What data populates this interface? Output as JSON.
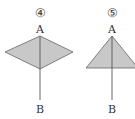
{
  "figures": [
    {
      "number": "④",
      "shape": "rhombus",
      "top_label": "A",
      "bottom_label": "B"
    },
    {
      "number": "⑤",
      "shape": "triangle",
      "top_label": "A",
      "bottom_label": "B"
    }
  ],
  "colors": {
    "fill": "#c8c8c8",
    "stroke": "#555555",
    "text": "#333333"
  }
}
